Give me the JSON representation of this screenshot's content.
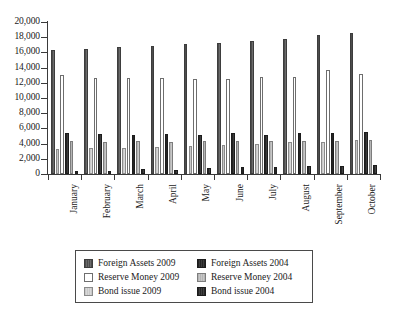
{
  "chart_data": {
    "type": "bar",
    "title": "",
    "subtitle": "",
    "xlabel": "",
    "ylabel": "",
    "ylim": [
      0,
      20000
    ],
    "ytick_step": 2000,
    "ytick_labels": [
      "0",
      "2,000",
      "4,000",
      "6,000",
      "8,000",
      "10,000",
      "12,000",
      "14,000",
      "16,000",
      "18,000",
      "20,000"
    ],
    "ytick_values": [
      0,
      2000,
      4000,
      6000,
      8000,
      10000,
      12000,
      14000,
      16000,
      18000,
      20000
    ],
    "grid": false,
    "legend_position": "bottom",
    "categories": [
      "January",
      "February",
      "March",
      "April",
      "May",
      "June",
      "July",
      "August",
      "September",
      "October"
    ],
    "series": [
      {
        "name": "Foreign Assets 2009",
        "color": "#595959",
        "values": [
          16350,
          16500,
          16650,
          16800,
          17150,
          17300,
          17450,
          17700,
          18250,
          18500
        ]
      },
      {
        "name": "Bond issue 2009",
        "color": "#cfcfcf",
        "values": [
          3300,
          3400,
          3400,
          3600,
          3650,
          3850,
          4000,
          4200,
          4250,
          4450
        ]
      },
      {
        "name": "Reserve Money 2009",
        "color": "#ffffff",
        "values": [
          13050,
          12600,
          12600,
          12600,
          12450,
          12550,
          12700,
          12800,
          13650,
          13150
        ]
      },
      {
        "name": "Foreign Assets 2004",
        "color": "#2e2e2e",
        "values": [
          5350,
          5200,
          5100,
          5250,
          5100,
          5350,
          5100,
          5400,
          5450,
          5550
        ]
      },
      {
        "name": "Reserve Money 2004",
        "color": "#bdbdbd",
        "values": [
          4350,
          4250,
          4300,
          4150,
          4350,
          4350,
          4350,
          4300,
          4300,
          4450
        ]
      },
      {
        "name": "Bond issue 2004",
        "color": "#303030",
        "values": [
          350,
          450,
          650,
          500,
          800,
          950,
          900,
          1000,
          1000,
          1150
        ]
      }
    ]
  },
  "legend": {
    "items": [
      {
        "label": "Foreign Assets 2009",
        "swatch": "foreign-assets-2009"
      },
      {
        "label": "Foreign Assets 2004",
        "swatch": "foreign-assets-2004"
      },
      {
        "label": "Reserve Money 2009",
        "swatch": "reserve-money-2009"
      },
      {
        "label": "Reserve Money 2004",
        "swatch": "reserve-money-2004"
      },
      {
        "label": "Bond issue 2009",
        "swatch": "bond-issue-2009"
      },
      {
        "label": "Bond issue 2004",
        "swatch": "bond-issue-2004"
      }
    ]
  }
}
